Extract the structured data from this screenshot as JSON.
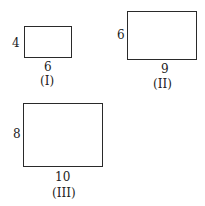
{
  "figures": [
    {
      "id": "I",
      "caption": "(I)",
      "height_label": "4",
      "width_label": "6"
    },
    {
      "id": "II",
      "caption": "(II)",
      "height_label": "6",
      "width_label": "9"
    },
    {
      "id": "III",
      "caption": "(III)",
      "height_label": "8",
      "width_label": "10"
    }
  ]
}
